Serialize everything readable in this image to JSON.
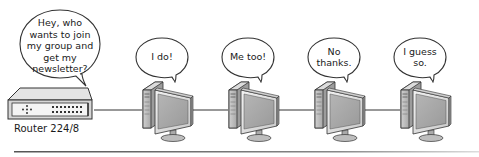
{
  "diagram": {
    "type": "multicast-network-illustration",
    "router": {
      "label": "Router 224/8",
      "speech": "Hey, who wants to join my group and get my newsletter?"
    },
    "computers": [
      {
        "id": 1,
        "speech": "I do!"
      },
      {
        "id": 2,
        "speech": "Me too!"
      },
      {
        "id": 3,
        "speech": "No thanks."
      },
      {
        "id": 4,
        "speech": "I guess so."
      }
    ],
    "connections": [
      [
        "router",
        "computer-1"
      ],
      [
        "computer-1",
        "computer-2"
      ],
      [
        "computer-2",
        "computer-3"
      ],
      [
        "computer-3",
        "computer-4"
      ]
    ],
    "colors": {
      "outline": "#333333",
      "bubble_fill": "#ffffff",
      "device_light": "#e6e6e6",
      "device_mid": "#b8b8b8",
      "device_dark": "#8a8a8a",
      "screen": "#a9a9a9",
      "rule": "#7a7a7a"
    }
  }
}
